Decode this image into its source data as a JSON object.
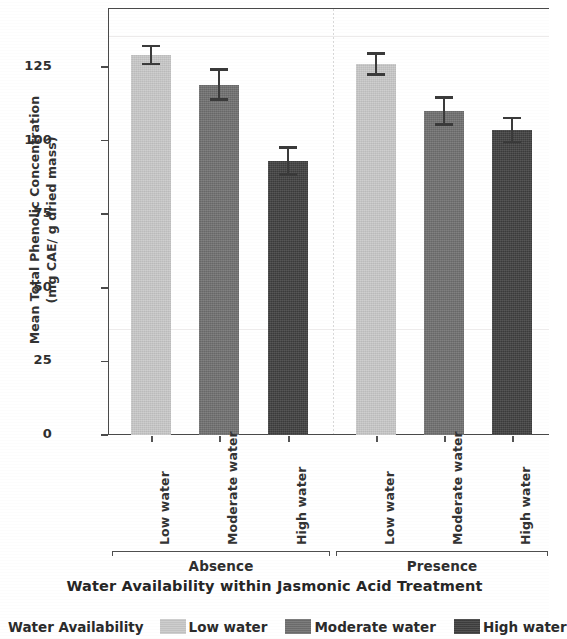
{
  "chart_data": {
    "type": "bar",
    "title": "",
    "xlabel": "Water Availability within Jasmonic Acid Treatment",
    "ylabel_line1": "Mean Total Phenolic Concentration",
    "ylabel_line2": "(mg CAE/ g dried mass)",
    "ylim": [
      0,
      145
    ],
    "yticks": [
      0,
      25,
      50,
      75,
      100,
      125
    ],
    "ytick_labels": [
      "0",
      "25",
      "50",
      "75",
      "100",
      "125"
    ],
    "grid": false,
    "legend_position": "bottom",
    "legend_title": "Water Availability",
    "panels": [
      {
        "name": "Absence"
      },
      {
        "name": "Presence"
      }
    ],
    "categories": [
      "Low water",
      "Moderate water",
      "High water"
    ],
    "series": [
      {
        "name": "Absence",
        "values": [
          129,
          119,
          93
        ],
        "err_upper": [
          132.5,
          124.5,
          98
        ],
        "err_lower": [
          125.5,
          113.5,
          88
        ]
      },
      {
        "name": "Presence",
        "values": [
          126,
          110,
          103.5
        ],
        "err_upper": [
          130,
          115,
          108
        ],
        "err_lower": [
          122,
          105,
          99
        ]
      }
    ],
    "bars": [
      {
        "panel": "Absence",
        "category": "Low water",
        "value": 129,
        "err_low": 125.5,
        "err_high": 132.5,
        "color": "#c9c9c9"
      },
      {
        "panel": "Absence",
        "category": "Moderate water",
        "value": 119,
        "err_low": 113.5,
        "err_high": 124.5,
        "color": "#6f6f6f"
      },
      {
        "panel": "Absence",
        "category": "High water",
        "value": 93,
        "err_low": 88,
        "err_high": 98,
        "color": "#3f3f3f"
      },
      {
        "panel": "Presence",
        "category": "Low water",
        "value": 126,
        "err_low": 122,
        "err_high": 130,
        "color": "#c9c9c9"
      },
      {
        "panel": "Presence",
        "category": "Moderate water",
        "value": 110,
        "err_low": 105,
        "err_high": 115,
        "color": "#6f6f6f"
      },
      {
        "panel": "Presence",
        "category": "High water",
        "value": 103.5,
        "err_low": 99,
        "err_high": 108,
        "color": "#3f3f3f"
      }
    ],
    "colors": {
      "low_water": "#c9c9c9",
      "moderate_water": "#6f6f6f",
      "high_water": "#3f3f3f",
      "axis": "#4a4a4a",
      "text": "#2b2b2b"
    }
  },
  "legend": {
    "title": "Water Availability",
    "entries": [
      {
        "label": "Low water",
        "color": "#c9c9c9"
      },
      {
        "label": "Moderate water",
        "color": "#6f6f6f"
      },
      {
        "label": "High water",
        "color": "#3f3f3f"
      }
    ]
  }
}
